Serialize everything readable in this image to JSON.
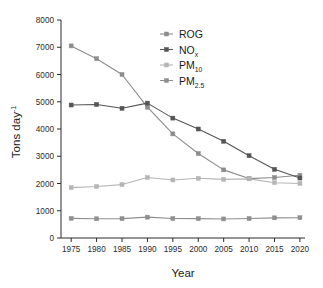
{
  "chart_data": {
    "type": "line",
    "title": "",
    "xlabel": "Year",
    "ylabel": "Tons day-1",
    "ylabel_display": "Tons day",
    "ylabel_exponent": "-1",
    "xlim": [
      1973,
      2021
    ],
    "ylim": [
      0,
      8000
    ],
    "grid": false,
    "legend_position": "top-right",
    "x": [
      1975,
      1980,
      1985,
      1990,
      1995,
      2000,
      2005,
      2010,
      2015,
      2020
    ],
    "xticks": [
      "1975",
      "1980",
      "1985",
      "1990",
      "1995",
      "2000",
      "2005",
      "2010",
      "2015",
      "2020"
    ],
    "yticks": [
      "0",
      "1000",
      "2000",
      "3000",
      "4000",
      "5000",
      "6000",
      "7000",
      "8000"
    ],
    "series": [
      {
        "name": "ROG",
        "label": "ROG",
        "color": "#8c8c8c",
        "marker": "square",
        "values": [
          7050,
          6580,
          6000,
          4800,
          3820,
          3100,
          2500,
          2180,
          2220,
          2300
        ]
      },
      {
        "name": "NOx",
        "label": "NO",
        "sublabel": "x",
        "color": "#555555",
        "marker": "square",
        "values": [
          4880,
          4900,
          4760,
          4950,
          4400,
          4000,
          3550,
          3020,
          2520,
          2200
        ]
      },
      {
        "name": "PM10",
        "label": "PM",
        "sublabel": "10",
        "color": "#b5b5b5",
        "marker": "square",
        "values": [
          1850,
          1890,
          1960,
          2220,
          2130,
          2190,
          2150,
          2170,
          2030,
          2000
        ]
      },
      {
        "name": "PM2.5",
        "label": "PM",
        "sublabel": "2.5",
        "color": "#8f8f8f",
        "marker": "square",
        "values": [
          720,
          705,
          710,
          765,
          715,
          710,
          700,
          715,
          740,
          745
        ]
      }
    ]
  },
  "axes": {
    "x_title": "Year",
    "y_title_base": "Tons day",
    "y_title_sup": "-1"
  },
  "colors": {
    "axis": "#2b2b2b",
    "background": "#ffffff"
  }
}
